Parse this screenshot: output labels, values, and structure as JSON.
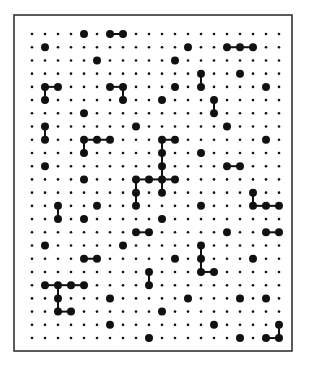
{
  "board": {
    "cols": 20,
    "rows": 24,
    "frame": {
      "x": 14,
      "y": 15,
      "width": 278,
      "height": 336
    },
    "origin": {
      "x": 32,
      "y": 34
    },
    "spacing": {
      "x": 13,
      "y": 13.22
    },
    "colors": {
      "frame": "#333333",
      "dot": "#111111",
      "line": "#111111",
      "background": "#ffffff"
    },
    "small_dot_radius": 1.3,
    "big_dot_radius": 4,
    "big_dots": [
      [
        0,
        4
      ],
      [
        0,
        6
      ],
      [
        0,
        7
      ],
      [
        1,
        1
      ],
      [
        1,
        12
      ],
      [
        1,
        15
      ],
      [
        1,
        16
      ],
      [
        1,
        17
      ],
      [
        2,
        5
      ],
      [
        2,
        11
      ],
      [
        3,
        13
      ],
      [
        3,
        16
      ],
      [
        4,
        1
      ],
      [
        4,
        2
      ],
      [
        4,
        6
      ],
      [
        4,
        7
      ],
      [
        4,
        11
      ],
      [
        4,
        13
      ],
      [
        4,
        18
      ],
      [
        5,
        1
      ],
      [
        5,
        7
      ],
      [
        5,
        10
      ],
      [
        5,
        14
      ],
      [
        6,
        4
      ],
      [
        6,
        14
      ],
      [
        7,
        1
      ],
      [
        7,
        8
      ],
      [
        7,
        15
      ],
      [
        8,
        1
      ],
      [
        8,
        4
      ],
      [
        8,
        5
      ],
      [
        8,
        6
      ],
      [
        8,
        10
      ],
      [
        8,
        11
      ],
      [
        8,
        18
      ],
      [
        9,
        4
      ],
      [
        9,
        10
      ],
      [
        9,
        13
      ],
      [
        10,
        1
      ],
      [
        10,
        10
      ],
      [
        10,
        15
      ],
      [
        10,
        16
      ],
      [
        11,
        4
      ],
      [
        11,
        8
      ],
      [
        11,
        9
      ],
      [
        11,
        10
      ],
      [
        11,
        11
      ],
      [
        12,
        8
      ],
      [
        12,
        10
      ],
      [
        12,
        17
      ],
      [
        13,
        2
      ],
      [
        13,
        5
      ],
      [
        13,
        8
      ],
      [
        13,
        13
      ],
      [
        13,
        17
      ],
      [
        13,
        18
      ],
      [
        13,
        19
      ],
      [
        14,
        2
      ],
      [
        14,
        4
      ],
      [
        14,
        10
      ],
      [
        15,
        8
      ],
      [
        15,
        9
      ],
      [
        15,
        15
      ],
      [
        15,
        18
      ],
      [
        15,
        19
      ],
      [
        16,
        1
      ],
      [
        16,
        7
      ],
      [
        16,
        13
      ],
      [
        17,
        4
      ],
      [
        17,
        5
      ],
      [
        17,
        11
      ],
      [
        17,
        13
      ],
      [
        17,
        17
      ],
      [
        18,
        9
      ],
      [
        18,
        13
      ],
      [
        18,
        14
      ],
      [
        19,
        1
      ],
      [
        19,
        2
      ],
      [
        19,
        3
      ],
      [
        19,
        4
      ],
      [
        19,
        9
      ],
      [
        20,
        2
      ],
      [
        20,
        6
      ],
      [
        20,
        12
      ],
      [
        20,
        16
      ],
      [
        20,
        18
      ],
      [
        21,
        2
      ],
      [
        21,
        3
      ],
      [
        21,
        10
      ],
      [
        22,
        6
      ],
      [
        22,
        14
      ],
      [
        22,
        19
      ],
      [
        23,
        9
      ],
      [
        23,
        16
      ],
      [
        23,
        18
      ],
      [
        23,
        19
      ]
    ],
    "links": [
      [
        [
          0,
          6
        ],
        [
          0,
          7
        ]
      ],
      [
        [
          1,
          15
        ],
        [
          1,
          16
        ]
      ],
      [
        [
          1,
          16
        ],
        [
          1,
          17
        ]
      ],
      [
        [
          3,
          13
        ],
        [
          4,
          13
        ]
      ],
      [
        [
          4,
          1
        ],
        [
          4,
          2
        ]
      ],
      [
        [
          4,
          1
        ],
        [
          5,
          1
        ]
      ],
      [
        [
          4,
          6
        ],
        [
          4,
          7
        ]
      ],
      [
        [
          4,
          7
        ],
        [
          5,
          7
        ]
      ],
      [
        [
          5,
          14
        ],
        [
          6,
          14
        ]
      ],
      [
        [
          7,
          1
        ],
        [
          8,
          1
        ]
      ],
      [
        [
          8,
          4
        ],
        [
          8,
          5
        ]
      ],
      [
        [
          8,
          5
        ],
        [
          8,
          6
        ]
      ],
      [
        [
          8,
          4
        ],
        [
          9,
          4
        ]
      ],
      [
        [
          8,
          10
        ],
        [
          8,
          11
        ]
      ],
      [
        [
          8,
          10
        ],
        [
          9,
          10
        ]
      ],
      [
        [
          9,
          10
        ],
        [
          10,
          10
        ]
      ],
      [
        [
          10,
          10
        ],
        [
          11,
          10
        ]
      ],
      [
        [
          10,
          15
        ],
        [
          10,
          16
        ]
      ],
      [
        [
          11,
          8
        ],
        [
          11,
          9
        ]
      ],
      [
        [
          11,
          9
        ],
        [
          11,
          10
        ]
      ],
      [
        [
          11,
          10
        ],
        [
          11,
          11
        ]
      ],
      [
        [
          11,
          8
        ],
        [
          12,
          8
        ]
      ],
      [
        [
          11,
          10
        ],
        [
          12,
          10
        ]
      ],
      [
        [
          12,
          8
        ],
        [
          13,
          8
        ]
      ],
      [
        [
          12,
          17
        ],
        [
          13,
          17
        ]
      ],
      [
        [
          13,
          2
        ],
        [
          14,
          2
        ]
      ],
      [
        [
          13,
          17
        ],
        [
          13,
          18
        ]
      ],
      [
        [
          13,
          18
        ],
        [
          13,
          19
        ]
      ],
      [
        [
          15,
          8
        ],
        [
          15,
          9
        ]
      ],
      [
        [
          15,
          18
        ],
        [
          15,
          19
        ]
      ],
      [
        [
          16,
          13
        ],
        [
          17,
          13
        ]
      ],
      [
        [
          17,
          13
        ],
        [
          18,
          13
        ]
      ],
      [
        [
          17,
          4
        ],
        [
          17,
          5
        ]
      ],
      [
        [
          18,
          13
        ],
        [
          18,
          14
        ]
      ],
      [
        [
          18,
          9
        ],
        [
          19,
          9
        ]
      ],
      [
        [
          19,
          1
        ],
        [
          19,
          2
        ]
      ],
      [
        [
          19,
          2
        ],
        [
          19,
          3
        ]
      ],
      [
        [
          19,
          3
        ],
        [
          19,
          4
        ]
      ],
      [
        [
          19,
          2
        ],
        [
          20,
          2
        ]
      ],
      [
        [
          20,
          2
        ],
        [
          21,
          2
        ]
      ],
      [
        [
          21,
          2
        ],
        [
          21,
          3
        ]
      ],
      [
        [
          22,
          19
        ],
        [
          23,
          19
        ]
      ],
      [
        [
          23,
          18
        ],
        [
          23,
          19
        ]
      ]
    ]
  }
}
